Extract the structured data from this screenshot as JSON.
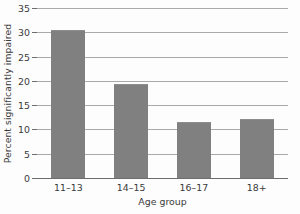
{
  "chart_data": {
    "type": "bar",
    "title": "",
    "xlabel": "Age group",
    "ylabel": "Percent significantly impaired",
    "categories": [
      "11–13",
      "14–15",
      "16–17",
      "18+"
    ],
    "values": [
      30.3,
      19.1,
      11.4,
      12.0
    ],
    "ylim": [
      0,
      35
    ],
    "ytick_labels": [
      "0",
      "5",
      "10",
      "15",
      "20",
      "25",
      "30",
      "35"
    ],
    "ytick_values": [
      0,
      5,
      10,
      15,
      20,
      25,
      30,
      35
    ],
    "grid": true,
    "legend": false,
    "bar_color": "#808080",
    "gridline_color": "#a9a9a9",
    "axis_color": "#6d6d6d",
    "text_color": "#3a3a3a",
    "background_color": "#fdfdfd"
  }
}
